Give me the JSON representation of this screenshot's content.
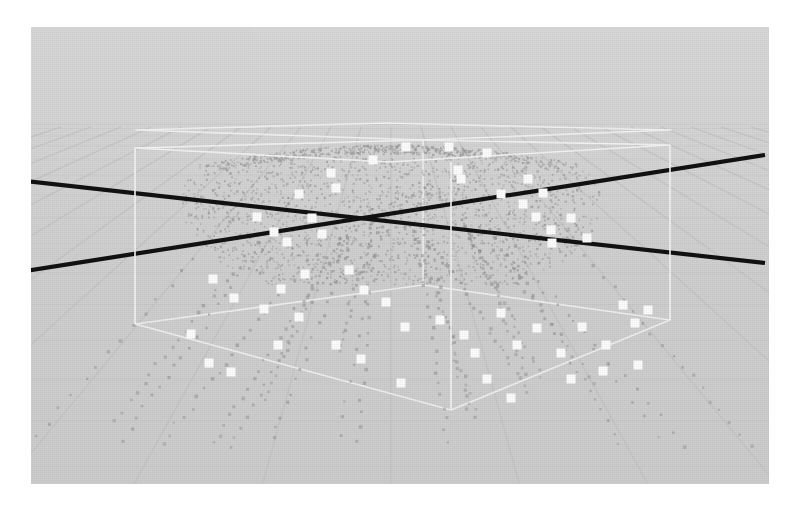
{
  "app": {
    "title": "3D Particle Simulation Viewport",
    "view_mode": "perspective",
    "background_color": "#d3d3d3"
  },
  "viewport": {
    "name": "render-canvas",
    "x": 31,
    "y": 27,
    "width": 738,
    "height": 457,
    "margin_color": "#ffffff"
  },
  "scene": {
    "grid": {
      "name": "ground-grid",
      "color": "#c2c2c2",
      "highlight_color": "#bdbdbd",
      "line_width": 1.1,
      "horizon_y": 96,
      "vanish_x": 360,
      "u_lines": 13,
      "v_lines": 13
    },
    "axes": {
      "name": "world-axes",
      "color": "#111111",
      "line_width": 4.2,
      "lines": [
        {
          "name": "axis-x",
          "x1": -6,
          "y1": 154,
          "x2": 734,
          "y2": 236
        },
        {
          "name": "axis-y",
          "x1": -6,
          "y1": 244,
          "x2": 734,
          "y2": 128
        }
      ]
    },
    "bounding_box": {
      "name": "simulation-bounds",
      "color": "#f4f4f4",
      "line_width": 1.7,
      "top_back": [
        [
          105,
          103
        ],
        [
          355,
          96
        ],
        [
          640,
          103
        ],
        [
          392,
          113
        ]
      ],
      "top_front": [
        [
          104,
          121
        ],
        [
          357,
          135
        ],
        [
          639,
          118
        ],
        [
          392,
          113
        ]
      ],
      "bottom": [
        [
          104,
          297
        ],
        [
          420,
          383
        ],
        [
          639,
          293
        ],
        [
          392,
          258
        ]
      ],
      "verticals": [
        {
          "name": "edge-left-front",
          "x1": 104,
          "y1": 121,
          "x2": 104,
          "y2": 297
        },
        {
          "name": "edge-right-front",
          "x1": 639,
          "y1": 118,
          "x2": 639,
          "y2": 293
        },
        {
          "name": "edge-center-back",
          "x1": 392,
          "y1": 113,
          "x2": 392,
          "y2": 258
        },
        {
          "name": "edge-center-front",
          "x1": 420,
          "y1": 135,
          "x2": 420,
          "y2": 383
        }
      ]
    },
    "particles": {
      "name": "particle-cloud",
      "dome_color": "#9a9a9a",
      "trail_color": "#8d8d8d",
      "marker_color": "#fdfdfd",
      "marker_size": 9,
      "dome_center_x": 360,
      "dome_center_y": 205,
      "dome_radius_x": 210,
      "dome_radius_y": 96,
      "dome_point_count": 2600,
      "trail_count": 22,
      "markers": [
        [
          226,
          190
        ],
        [
          268,
          167
        ],
        [
          281,
          191
        ],
        [
          305,
          161
        ],
        [
          300,
          146
        ],
        [
          243,
          205
        ],
        [
          256,
          215
        ],
        [
          291,
          207
        ],
        [
          342,
          133
        ],
        [
          375,
          120
        ],
        [
          418,
          120
        ],
        [
          427,
          143
        ],
        [
          430,
          152
        ],
        [
          456,
          126
        ],
        [
          470,
          167
        ],
        [
          497,
          152
        ],
        [
          492,
          177
        ],
        [
          505,
          190
        ],
        [
          512,
          166
        ],
        [
          520,
          203
        ],
        [
          521,
          216
        ],
        [
          540,
          191
        ],
        [
          556,
          211
        ],
        [
          182,
          252
        ],
        [
          203,
          271
        ],
        [
          233,
          282
        ],
        [
          250,
          262
        ],
        [
          274,
          247
        ],
        [
          268,
          290
        ],
        [
          318,
          243
        ],
        [
          333,
          263
        ],
        [
          355,
          275
        ],
        [
          374,
          300
        ],
        [
          247,
          318
        ],
        [
          305,
          318
        ],
        [
          330,
          332
        ],
        [
          409,
          293
        ],
        [
          433,
          308
        ],
        [
          444,
          326
        ],
        [
          470,
          286
        ],
        [
          486,
          318
        ],
        [
          506,
          301
        ],
        [
          530,
          326
        ],
        [
          551,
          300
        ],
        [
          575,
          318
        ],
        [
          592,
          278
        ],
        [
          604,
          296
        ],
        [
          617,
          283
        ],
        [
          160,
          307
        ],
        [
          178,
          336
        ],
        [
          200,
          345
        ],
        [
          370,
          356
        ],
        [
          456,
          352
        ],
        [
          480,
          371
        ],
        [
          540,
          352
        ],
        [
          572,
          344
        ],
        [
          607,
          338
        ]
      ]
    }
  },
  "overlay": {
    "status": "",
    "frame_label": "",
    "zoom_level": ""
  }
}
